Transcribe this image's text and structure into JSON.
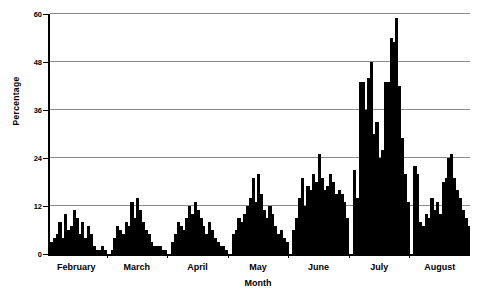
{
  "chart_data": {
    "type": "bar",
    "title": "",
    "xlabel": "Month",
    "ylabel": "Percentage",
    "ylim": [
      0,
      60
    ],
    "yticks": [
      0,
      12,
      24,
      36,
      48,
      60
    ],
    "grid": true,
    "legend": false,
    "bar_color": "#000000",
    "categories": [
      "February",
      "March",
      "April",
      "May",
      "June",
      "July",
      "August"
    ],
    "groups": [
      {
        "name": "February",
        "values": [
          3,
          4,
          5,
          8,
          4,
          10,
          6,
          7,
          11,
          9,
          5,
          8,
          4,
          7,
          5,
          2,
          1,
          1,
          2,
          1
        ]
      },
      {
        "name": "March",
        "values": [
          1,
          4,
          7,
          6,
          5,
          8,
          7,
          13,
          9,
          14,
          11,
          8,
          6,
          5,
          3,
          2,
          2,
          2,
          1,
          1
        ]
      },
      {
        "name": "April",
        "values": [
          3,
          5,
          8,
          7,
          6,
          9,
          12,
          10,
          13,
          11,
          9,
          7,
          5,
          8,
          6,
          4,
          3,
          2,
          2,
          1
        ]
      },
      {
        "name": "May",
        "values": [
          5,
          6,
          9,
          8,
          10,
          12,
          14,
          19,
          13,
          20,
          15,
          11,
          9,
          12,
          10,
          7,
          5,
          6,
          4,
          3
        ]
      },
      {
        "name": "June",
        "values": [
          6,
          9,
          14,
          19,
          12,
          17,
          16,
          20,
          18,
          25,
          19,
          16,
          17,
          20,
          18,
          15,
          16,
          15,
          13,
          9
        ]
      },
      {
        "name": "July",
        "values": [
          21,
          14,
          43,
          43,
          36,
          44,
          48,
          30,
          33,
          24,
          26,
          43,
          43,
          54,
          53,
          59,
          42,
          29,
          20,
          13
        ]
      },
      {
        "name": "August",
        "values": [
          22,
          20,
          8,
          7,
          10,
          9,
          14,
          11,
          13,
          10,
          18,
          19,
          24,
          25,
          19,
          16,
          14,
          11,
          9,
          7
        ]
      }
    ]
  },
  "axis": {
    "y_title": "Percentage",
    "x_title": "Month",
    "y_tick_labels": [
      "0",
      "12",
      "24",
      "36",
      "48",
      "60"
    ]
  }
}
